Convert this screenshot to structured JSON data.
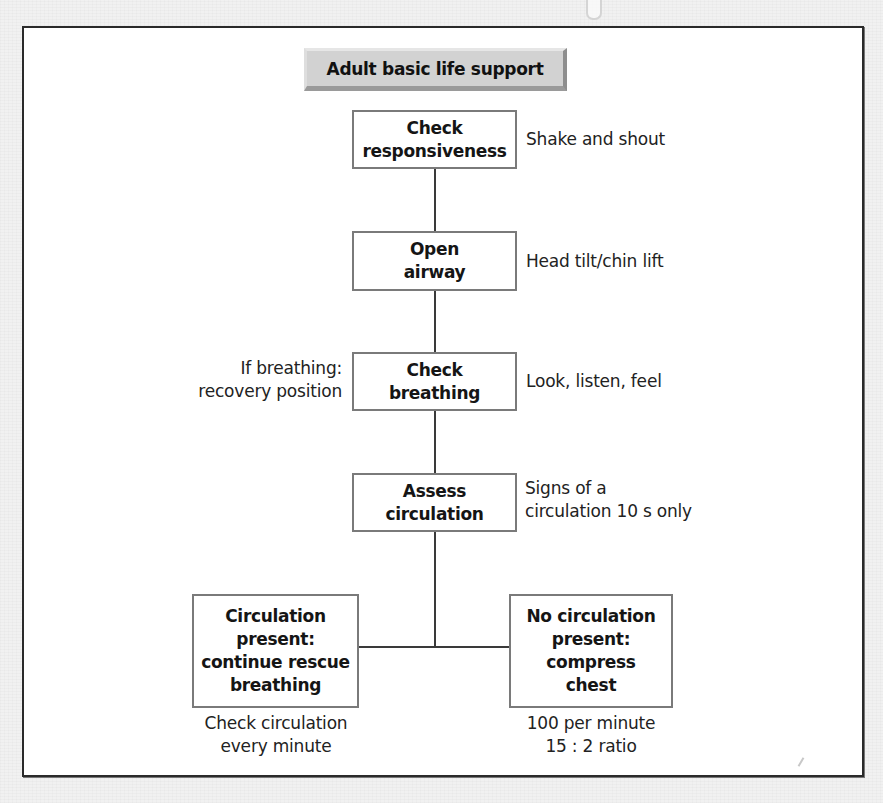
{
  "title": "Adult basic life support",
  "steps": [
    {
      "id": "check-responsiveness",
      "lines": [
        "Check",
        "responsiveness"
      ],
      "note_right": [
        "Shake and shout"
      ]
    },
    {
      "id": "open-airway",
      "lines": [
        "Open",
        "airway"
      ],
      "note_right": [
        "Head tilt/chin lift"
      ]
    },
    {
      "id": "check-breathing",
      "lines": [
        "Check",
        "breathing"
      ],
      "note_left": [
        "If breathing:",
        "recovery position"
      ],
      "note_right": [
        "Look, listen, feel"
      ]
    },
    {
      "id": "assess-circulation",
      "lines": [
        "Assess",
        "circulation"
      ],
      "note_right": [
        "Signs of a",
        "circulation 10 s only"
      ]
    }
  ],
  "branches": [
    {
      "id": "circulation-present",
      "lines": [
        "Circulation",
        "present:",
        "continue rescue",
        "breathing"
      ],
      "note_below": [
        "Check circulation",
        "every minute"
      ]
    },
    {
      "id": "no-circulation",
      "lines": [
        "No circulation",
        "present:",
        "compress",
        "chest"
      ],
      "note_below": [
        "100 per minute",
        "15 : 2 ratio"
      ]
    }
  ],
  "colors": {
    "frame_border": "#2a2a2a",
    "box_border": "#7a7a7a",
    "title_fill": "#d2d2d2",
    "connector": "#3a3a3a",
    "background": "#f1f1f1"
  }
}
